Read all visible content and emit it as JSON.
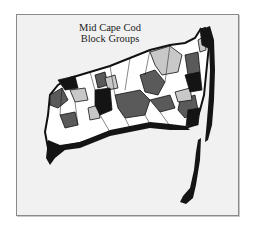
{
  "map": {
    "title_line1": "Mid Cape Cod",
    "title_line2": "Block Groups",
    "region": "Mid Cape Cod",
    "unit": "Block Groups",
    "type": "choropleth",
    "colors": {
      "background": "#ffffff",
      "frame_fill": "#f1f1f1",
      "frame_border": "#8a8a8a",
      "class_1": "#ffffff",
      "class_2": "#c8c8c8",
      "class_3": "#5a5a5a",
      "class_4": "#141414",
      "boundary": "#111111"
    }
  }
}
